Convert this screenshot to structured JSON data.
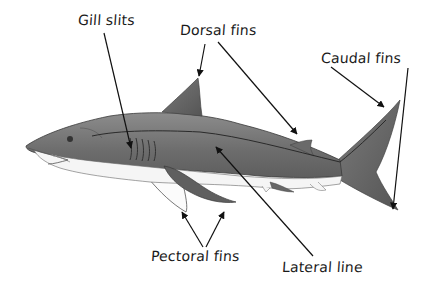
{
  "diagram": {
    "labels": {
      "gill_slits": "Gill slits",
      "dorsal_fins": "Dorsal fins",
      "caudal_fins": "Caudal fins",
      "pectoral_fins": "Pectoral fins",
      "lateral_line": "Lateral line"
    },
    "colors": {
      "background": "#ffffff",
      "body_dark": "#6e6e6e",
      "body_mid": "#8a8a8a",
      "belly": "#f4f4f4",
      "outline": "#3a3a3a",
      "arrow": "#111111",
      "text": "#1a1a1a"
    }
  }
}
